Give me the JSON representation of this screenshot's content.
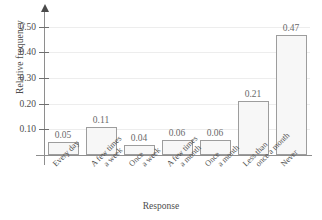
{
  "chart_data": {
    "type": "bar",
    "title": "",
    "subtitle": "",
    "xlabel": "Response",
    "ylabel": "Relative frequency",
    "categories": [
      "Every day",
      "A few times a week",
      "Once a week",
      "A few times a month",
      "Once a month",
      "Less than once a month",
      "Never"
    ],
    "category_lines": [
      [
        "Every day",
        ""
      ],
      [
        "A few times",
        "a week"
      ],
      [
        "Once",
        "a week"
      ],
      [
        "A few times",
        "a month"
      ],
      [
        "Once",
        "a month"
      ],
      [
        "Less than",
        "once a month"
      ],
      [
        "Never",
        ""
      ]
    ],
    "values": [
      0.05,
      0.11,
      0.04,
      0.06,
      0.06,
      0.21,
      0.47
    ],
    "value_labels": [
      "0.05",
      "0.11",
      "0.04",
      "0.06",
      "0.06",
      "0.21",
      "0.47"
    ],
    "ylim": [
      0.0,
      0.55
    ],
    "yticks": [
      0.1,
      0.2,
      0.3,
      0.4,
      0.5
    ],
    "ytick_labels": [
      "0.10",
      "0.20",
      "0.30",
      "0.40",
      "0.50"
    ],
    "grid": true,
    "legend": null,
    "bar_fill_color": "#f7f7f7",
    "bar_border_color": "#9d9d9d",
    "gridline_color": "#ededed",
    "axis_color": "#8e8e8e",
    "text_color": "#4d4d4d"
  }
}
